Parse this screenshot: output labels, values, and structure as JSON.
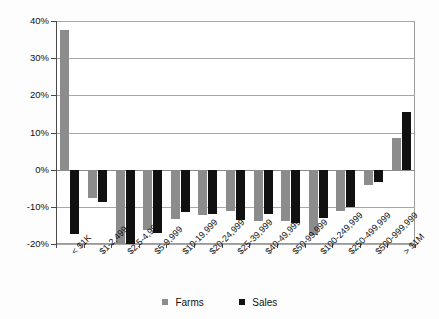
{
  "chart_data": {
    "type": "bar",
    "title": "",
    "subtitle": "",
    "xlabel": "",
    "ylabel": "",
    "orientation": "vertical",
    "grouping": "grouped",
    "grid": true,
    "gridlines_axis": "y",
    "legend_position": "bottom",
    "ylim": [
      -20,
      40
    ],
    "ytick_step": 10,
    "ytick_labels": [
      "40%",
      "30%",
      "20%",
      "10%",
      "0%",
      "-10%",
      "-20%"
    ],
    "ytick_values": [
      40,
      30,
      20,
      10,
      0,
      -10,
      -20
    ],
    "categories": [
      "< $1K",
      "$1-2,499",
      "$2.5-4,999",
      "$5-9,999",
      "$10-19,999",
      "$20-24,999",
      "$25-39,999",
      "$40-49,999",
      "$50-99,999",
      "$100-249,999",
      "$250-499,999",
      "$500-999,999",
      "> $1M"
    ],
    "series": [
      {
        "name": "Farms",
        "color": "#8c8c8c",
        "values": [
          37.5,
          -7.5,
          -20.0,
          -16.3,
          -13.3,
          -12.3,
          -11.0,
          -13.8,
          -13.8,
          -17.5,
          -11.0,
          -4.0,
          8.5
        ]
      },
      {
        "name": "Sales",
        "color": "#111111",
        "values": [
          -17.3,
          -8.8,
          -20.0,
          -17.0,
          -11.5,
          -11.8,
          -13.5,
          -11.8,
          -14.3,
          -13.0,
          -10.0,
          -3.3,
          15.5
        ]
      }
    ]
  },
  "legend": {
    "items": [
      {
        "label": "Farms",
        "swatch": "legend-swatch-farms"
      },
      {
        "label": "Sales",
        "swatch": "legend-swatch-sales"
      }
    ]
  }
}
